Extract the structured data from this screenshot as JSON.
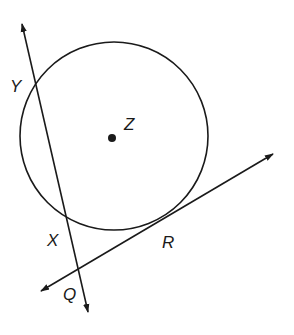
{
  "diagram": {
    "type": "geometry",
    "colors": {
      "stroke": "#1a1a1a",
      "background": "#ffffff"
    },
    "circle": {
      "name": "Z",
      "center": [
        114,
        136
      ],
      "radius": 94
    },
    "labels": {
      "Y": "Y",
      "Z": "Z",
      "X": "X",
      "R": "R",
      "Q": "Q"
    },
    "secant_line": {
      "through": [
        "Y",
        "X",
        "Q"
      ],
      "from": [
        21,
        20
      ],
      "to": [
        89,
        316
      ],
      "arrows": "both"
    },
    "tangent_line": {
      "through": [
        "Q",
        "R"
      ],
      "from": [
        37,
        293
      ],
      "to": [
        277,
        152
      ],
      "arrows": "both",
      "tangent_point": "R"
    }
  }
}
